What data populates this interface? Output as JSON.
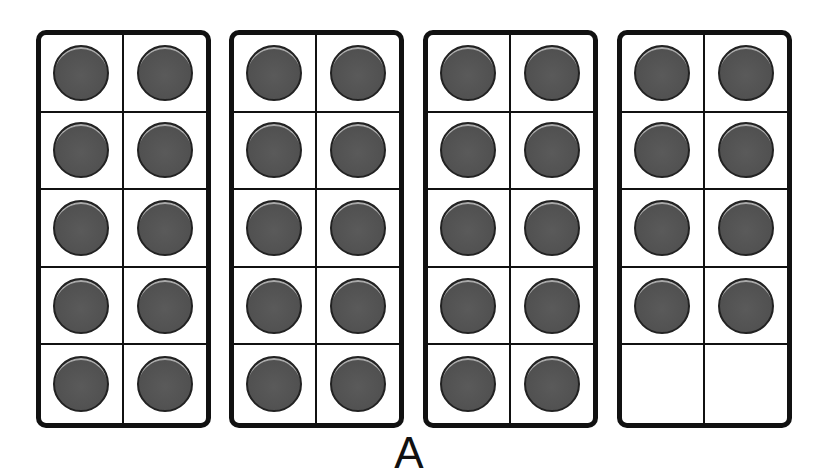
{
  "diagram": {
    "type": "ten-frames",
    "label": "A",
    "frames": [
      {
        "filled": 10,
        "cells": [
          1,
          1,
          1,
          1,
          1,
          1,
          1,
          1,
          1,
          1
        ]
      },
      {
        "filled": 10,
        "cells": [
          1,
          1,
          1,
          1,
          1,
          1,
          1,
          1,
          1,
          1
        ]
      },
      {
        "filled": 10,
        "cells": [
          1,
          1,
          1,
          1,
          1,
          1,
          1,
          1,
          1,
          1
        ]
      },
      {
        "filled": 8,
        "cells": [
          1,
          1,
          1,
          1,
          1,
          1,
          1,
          1,
          0,
          0
        ]
      }
    ],
    "total_counters": 38,
    "colors": {
      "counter": "#505050",
      "border": "#111111",
      "background": "#ffffff"
    }
  }
}
